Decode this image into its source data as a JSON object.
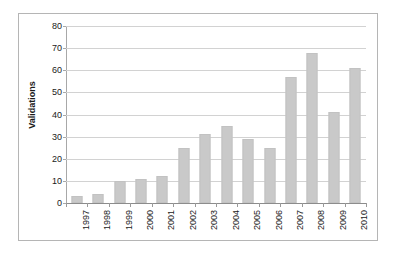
{
  "chart_data": {
    "type": "bar",
    "title": "",
    "xlabel": "",
    "ylabel": "Validations",
    "categories": [
      "1997",
      "1998",
      "1999",
      "2000",
      "2001",
      "2002",
      "2003",
      "2004",
      "2005",
      "2006",
      "2007",
      "2008",
      "2009",
      "2010"
    ],
    "values": [
      3,
      4,
      10,
      11,
      12,
      25,
      31,
      35,
      29,
      25,
      57,
      68,
      41,
      61
    ],
    "ylim": [
      0,
      80
    ],
    "y_ticks": [
      0,
      10,
      20,
      30,
      40,
      50,
      60,
      70,
      80
    ],
    "y_tick_labels": [
      "0",
      "10",
      "20",
      "30",
      "40",
      "50",
      "60",
      "70",
      "80"
    ],
    "grid": true,
    "grid_axis": "y",
    "legend": false,
    "legend_position": "none",
    "bar_color": "#c9c9c9",
    "gridline_color": "#d2d2d2",
    "axis_color": "#a8a8a8",
    "frame_color": "#b5b5b5",
    "text_color": "#1a1a1a",
    "x_tick_label_rotation": -90
  }
}
